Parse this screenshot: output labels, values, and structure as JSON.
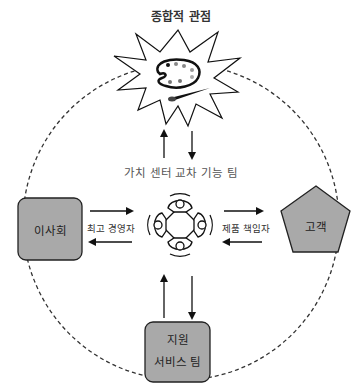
{
  "diagram": {
    "title": "종합적 관점",
    "center_team": "가치 센터 교차 기능 팀",
    "nodes": {
      "board": {
        "label": "이사회",
        "shape": "rounded-rect"
      },
      "customer": {
        "label": "고객",
        "shape": "pentagon"
      },
      "support": {
        "label_line1": "지원",
        "label_line2": "서비스 팀",
        "shape": "rounded-rect"
      },
      "holistic": {
        "shape": "starburst",
        "icon": "palette-icon"
      },
      "team": {
        "shape": "meeting-table",
        "icon": "meeting-table-icon"
      }
    },
    "edges": {
      "board_team": "최고 경영자",
      "team_customer": "제품 책임자"
    },
    "colors": {
      "node_fill": "#a9a9a9",
      "node_stroke": "#222222",
      "dashed_circle": "#333333",
      "background": "#ffffff"
    }
  }
}
